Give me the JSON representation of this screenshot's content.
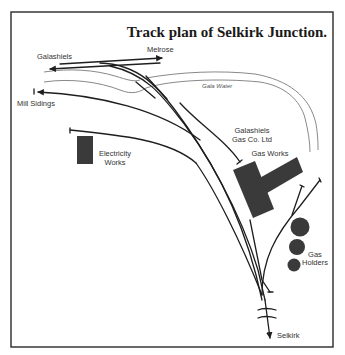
{
  "diagram": {
    "title": "Track plan of Selkirk Junction.",
    "labels": {
      "galashiels": "Galashiels",
      "melrose": "Melrose",
      "gala_water": "Gala Water",
      "mill_sidings": "Mill Sidings",
      "electricity_line1": "Electricity",
      "electricity_line2": "Works",
      "gasco_line1": "Galashiels",
      "gasco_line2": "Gas Co. Ltd",
      "gas_works": "Gas Works",
      "gas_holders_line1": "Gas",
      "gas_holders_line2": "Holders",
      "selkirk": "Selkirk"
    },
    "colors": {
      "track": "#1e1e1e",
      "river": "#6a6a6a",
      "building": "#3a3a3a",
      "frame": "#2a2a2a",
      "background": "#ffffff"
    },
    "features": {
      "destinations": [
        "Galashiels",
        "Melrose",
        "Mill Sidings",
        "Selkirk"
      ],
      "buildings": [
        "Electricity Works",
        "Gas Works"
      ],
      "gas_holders_count": 3,
      "river": "Gala Water"
    }
  }
}
